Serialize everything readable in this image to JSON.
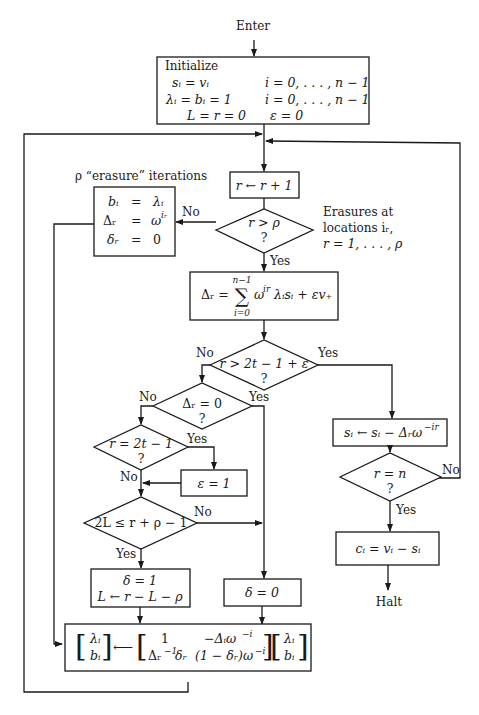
{
  "figure": {
    "enter_label": "Enter",
    "halt_label": "Halt",
    "initialize": {
      "title": "Initialize",
      "rows": [
        {
          "left": "sᵢ = vᵢ",
          "right": "i = 0, . . . , n − 1"
        },
        {
          "left": "λᵢ = bᵢ = 1",
          "right": "i = 0, . . . , n − 1"
        },
        {
          "left": "L = r = 0",
          "right": "ε = 0"
        }
      ]
    },
    "increment_box": "r ← r + 1",
    "erasure_note": "ρ “erasure” iterations",
    "erasure_box": {
      "rows": [
        {
          "lhs": "bᵢ",
          "eq": "=",
          "rhs": "λᵢ"
        },
        {
          "lhs": "Δᵣ",
          "eq": "=",
          "rhs": "ω",
          "rhs_sup": "iᵣ"
        },
        {
          "lhs": "δᵣ",
          "eq": "=",
          "rhs": "0"
        }
      ]
    },
    "decision_r_gt_rho": {
      "line1": "r > ρ",
      "line2": "?",
      "no": "No",
      "yes": "Yes"
    },
    "erasure_locations_note": [
      "Erasures at",
      "locations iᵣ,",
      "r = 1, . . . , ρ"
    ],
    "discrepancy_box": {
      "lhs": "Δᵣ =",
      "sum_upper": "n−1",
      "sum_symbol": "∑",
      "sum_lower": "i=0",
      "term": "ω",
      "term_sup": "ir",
      "rest": "λᵢsᵢ + εv₊"
    },
    "decision_r_gt_2t": {
      "line1": "r > 2t − 1 + ε",
      "line2": "?",
      "no": "No",
      "yes": "Yes"
    },
    "decision_delta_zero": {
      "line1": "Δᵣ = 0",
      "line2": "?",
      "no": "No",
      "yes": "Yes"
    },
    "decision_r_eq_2t": {
      "line1": "r = 2t − 1",
      "line2": "?",
      "no": "No",
      "yes": "Yes"
    },
    "epsilon_box": "ε = 1",
    "decision_2L": {
      "line1": "2L ≤ r + ρ − 1",
      "no": "No",
      "yes": "Yes"
    },
    "delta_one_box": {
      "line1": "δ = 1",
      "line2": "L ← r − L − ρ"
    },
    "delta_zero_box": "δ = 0",
    "update_s_box": {
      "text": "sᵢ ← sᵢ − Δᵣω",
      "sup": "−ir"
    },
    "decision_r_eq_n": {
      "line1": "r = n",
      "line2": "?",
      "no": "No",
      "yes": "Yes"
    },
    "output_box": "cᵢ = vᵢ − sᵢ",
    "matrix_box": {
      "vec_left": [
        "λᵢ",
        "bᵢ"
      ],
      "arrow": "⟵",
      "m11": "1",
      "m12": "−Δᵢω",
      "m12_sup": "−i",
      "m21": "Δᵣ",
      "m21_sup": "−1",
      "m21_tail": "δᵣ",
      "m22": "(1 − δᵣ)ω",
      "m22_sup": "−i",
      "vec_right": [
        "λᵢ",
        "bᵢ"
      ]
    }
  }
}
